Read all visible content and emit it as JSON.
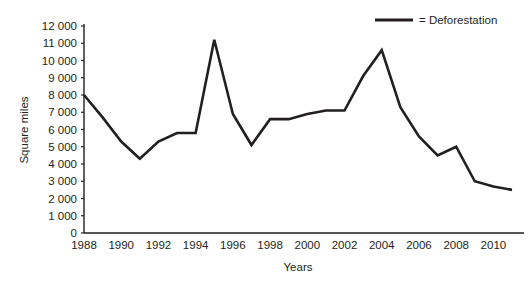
{
  "chart_data": {
    "type": "line",
    "title": "",
    "xlabel": "Years",
    "ylabel": "Square miles",
    "xlim": [
      1988,
      2011
    ],
    "ylim": [
      0,
      12000
    ],
    "grid": false,
    "legend_position": "top-right",
    "line_color": "#231f20",
    "x": [
      1988,
      1989,
      1990,
      1991,
      1992,
      1993,
      1994,
      1995,
      1996,
      1997,
      1998,
      1999,
      2000,
      2001,
      2002,
      2003,
      2004,
      2005,
      2006,
      2007,
      2008,
      2009,
      2010,
      2011
    ],
    "series": [
      {
        "name": "Deforestation",
        "legend_text": "= Deforestation",
        "values": [
          8000,
          6700,
          5300,
          4300,
          5300,
          5800,
          5800,
          11200,
          6900,
          5100,
          6600,
          6600,
          6900,
          7100,
          7100,
          9100,
          10600,
          7300,
          5600,
          4500,
          5000,
          3000,
          2700,
          2500
        ]
      }
    ],
    "ytick_values": [
      0,
      1000,
      2000,
      3000,
      4000,
      5000,
      6000,
      7000,
      8000,
      9000,
      10000,
      11000,
      12000
    ],
    "ytick_labels": [
      "0",
      "1 000",
      "2 000",
      "3 000",
      "4 000",
      "5 000",
      "6 000",
      "7 000",
      "8 000",
      "9 000",
      "10 000",
      "11 000",
      "12 000"
    ],
    "xtick_values": [
      1988,
      1990,
      1992,
      1994,
      1996,
      1998,
      2000,
      2002,
      2004,
      2006,
      2008,
      2010
    ],
    "xtick_labels": [
      "1988",
      "1990",
      "1992",
      "1994",
      "1996",
      "1998",
      "2000",
      "2002",
      "2004",
      "2006",
      "2008",
      "2010"
    ]
  }
}
